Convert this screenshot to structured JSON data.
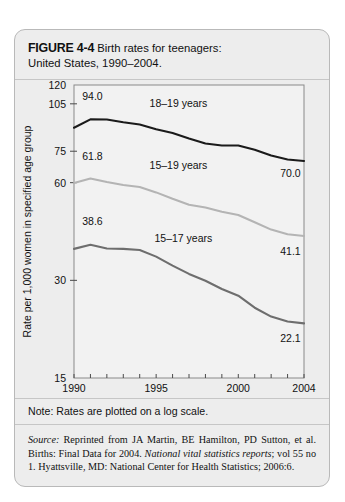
{
  "figure": {
    "label": "FIGURE 4-4",
    "title": "Birth rates for teenagers:",
    "subtitle": "United States, 1990–2004."
  },
  "note": {
    "text": "Note: Rates are plotted on a log scale."
  },
  "source": {
    "lead": "Source:",
    "part1": " Reprinted from JA Martin, BE Hamilton, PD Sutton, et al. Births: Final Data for 2004. ",
    "italic": "National vital statistics reports",
    "part2": "; vol 55 no 1. Hyattsville, MD: National Center for Health Statistics; 2006:6."
  },
  "chart_data": {
    "type": "line",
    "title": "Birth rates for teenagers: United States, 1990–2004",
    "xlabel": "Year",
    "ylabel": "Rate per 1,000 women in specified age group",
    "yscale": "log",
    "ylim": [
      15,
      120
    ],
    "xlim": [
      1990,
      2004
    ],
    "grid": false,
    "legend": "inline-labels",
    "yticks": [
      15,
      30,
      60,
      75,
      105,
      120
    ],
    "ytick_labels": [
      "15",
      "30",
      "60",
      "75",
      "105",
      "120"
    ],
    "xticks": [
      1990,
      1991,
      1992,
      1993,
      1994,
      1995,
      1996,
      1997,
      1998,
      1999,
      2000,
      2001,
      2002,
      2003,
      2004
    ],
    "xtick_labels": [
      "1990",
      "",
      "",
      "",
      "",
      "1995",
      "",
      "",
      "",
      "",
      "2000",
      "",
      "",
      "",
      "2004"
    ],
    "x": [
      1990,
      1991,
      1992,
      1993,
      1994,
      1995,
      1996,
      1997,
      1998,
      1999,
      2000,
      2001,
      2002,
      2003,
      2004
    ],
    "series": [
      {
        "name": "18–19 years",
        "color": "#1b1b1b",
        "width": 2.1,
        "start_label": "94.0",
        "end_label": "70.0",
        "label_x": 1994.6,
        "label_y": 103,
        "values": [
          88.6,
          94.0,
          93.9,
          92.1,
          90.7,
          87.7,
          85.4,
          82.1,
          79.2,
          78.1,
          78.1,
          75.8,
          72.8,
          70.7,
          70.0
        ]
      },
      {
        "name": "15–19 years",
        "color": "#b4b4b4",
        "width": 2.1,
        "start_label": "61.8",
        "end_label": "41.1",
        "label_x": 1994.6,
        "label_y": 66,
        "values": [
          59.9,
          61.8,
          60.3,
          59.0,
          58.2,
          56.0,
          53.5,
          51.3,
          50.3,
          48.8,
          47.7,
          45.3,
          43.0,
          41.6,
          41.1
        ]
      },
      {
        "name": "15–17 years",
        "color": "#6e6e6e",
        "width": 2.1,
        "start_label": "38.6",
        "end_label": "22.1",
        "label_x": 1994.9,
        "label_y": 39.5,
        "values": [
          37.5,
          38.6,
          37.6,
          37.5,
          37.2,
          35.5,
          33.3,
          31.4,
          29.9,
          28.2,
          26.9,
          24.7,
          23.2,
          22.4,
          22.1
        ]
      }
    ],
    "annotations": [
      {
        "text": "94.0",
        "x": 1990.5,
        "y": 108,
        "anchor": "start"
      },
      {
        "text": "61.8",
        "x": 1990.5,
        "y": 70.5,
        "anchor": "start"
      },
      {
        "text": "38.6",
        "x": 1990.5,
        "y": 44.5,
        "anchor": "start"
      },
      {
        "text": "70.0",
        "x": 2003.8,
        "y": 62.5,
        "anchor": "end"
      },
      {
        "text": "41.1",
        "x": 2003.8,
        "y": 36.0,
        "anchor": "end"
      },
      {
        "text": "22.1",
        "x": 2003.8,
        "y": 19.3,
        "anchor": "end"
      }
    ]
  }
}
